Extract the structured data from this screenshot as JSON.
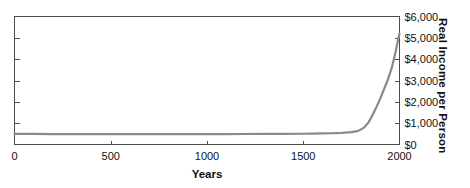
{
  "chart_data": {
    "type": "line",
    "title": "",
    "xlabel": "Years",
    "ylabel": "Real Income per Person",
    "xlim": [
      0,
      2000
    ],
    "ylim": [
      0,
      6000
    ],
    "grid": false,
    "legend": null,
    "x_ticks": [
      {
        "value": 0,
        "label": "0"
      },
      {
        "value": 500,
        "label": "500"
      },
      {
        "value": 1000,
        "label": "1000"
      },
      {
        "value": 1500,
        "label": "1500"
      },
      {
        "value": 2000,
        "label": "2000"
      }
    ],
    "y_ticks": [
      {
        "value": 0,
        "label": "$0"
      },
      {
        "value": 1000,
        "label": "$1,000"
      },
      {
        "value": 2000,
        "label": "$2,000"
      },
      {
        "value": 3000,
        "label": "$3,000"
      },
      {
        "value": 4000,
        "label": "$4,000"
      },
      {
        "value": 5000,
        "label": "$5,000"
      },
      {
        "value": 6000,
        "label": "$6,000"
      }
    ],
    "y_axis_side": "right",
    "series": [
      {
        "name": "Real income per person",
        "color": "#8a8a8a",
        "line_width": 2.2,
        "x": [
          0,
          100,
          200,
          300,
          400,
          500,
          600,
          700,
          800,
          900,
          1000,
          1100,
          1200,
          1300,
          1400,
          1500,
          1550,
          1600,
          1650,
          1700,
          1750,
          1780,
          1800,
          1820,
          1840,
          1860,
          1880,
          1900,
          1920,
          1940,
          1960,
          1980,
          1990,
          2000
        ],
        "y": [
          500,
          495,
          490,
          488,
          486,
          485,
          484,
          484,
          484,
          485,
          487,
          489,
          492,
          495,
          499,
          505,
          510,
          517,
          527,
          545,
          580,
          625,
          700,
          830,
          1050,
          1380,
          1750,
          2150,
          2600,
          3050,
          3600,
          4350,
          4800,
          5200
        ]
      }
    ]
  },
  "axes": {
    "frame_color": "#4d4d4d",
    "tick_color": "#4d4d4d",
    "background": "#ffffff"
  }
}
